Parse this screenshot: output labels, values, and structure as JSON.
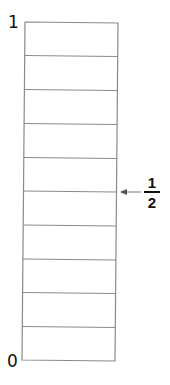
{
  "diagram": {
    "type": "fraction-strip",
    "orientation": "vertical",
    "divisions": 10,
    "top_label": "1",
    "bottom_label": "0",
    "marker": {
      "numerator": "1",
      "denominator": "2",
      "points_to_division": 5
    },
    "colors": {
      "line": "#8a8a8a",
      "text": "#111111",
      "arrow": "#666666"
    }
  }
}
